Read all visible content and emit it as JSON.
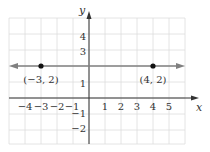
{
  "chart_data": {
    "type": "line",
    "title": "",
    "xlabel": "x",
    "ylabel": "y",
    "xlim": [
      -5,
      6
    ],
    "ylim": [
      -3,
      5
    ],
    "grid": true,
    "x_ticks": [
      "−4",
      "−3",
      "−2",
      "−1",
      "1",
      "2",
      "3",
      "4",
      "5"
    ],
    "y_ticks": [
      "4",
      "3",
      "1",
      "−1",
      "−2"
    ],
    "series": [
      {
        "name": "y = 2",
        "type": "horizontal-line",
        "y": 2,
        "arrows": "both",
        "color": "#777777"
      }
    ],
    "points": [
      {
        "x": -3,
        "y": 2,
        "label": "(−3, 2)"
      },
      {
        "x": 4,
        "y": 2,
        "label": "(4, 2)"
      }
    ]
  },
  "colors": {
    "grid": "#dddddd",
    "axis": "#333333",
    "line": "#808080",
    "point": "#111111"
  }
}
